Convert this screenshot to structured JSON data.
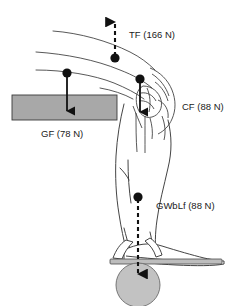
{
  "figure": {
    "type": "biomechanics-force-diagram",
    "title": "",
    "background_color": "#ffffff",
    "line_color": "#3a3a3a",
    "arrow_color": "#111111"
  },
  "forces": [
    {
      "id": "TF",
      "label": "TF (166 N)",
      "abbrev": "TF",
      "magnitude": 166,
      "unit": "N",
      "direction": "up",
      "line_style": "dashed",
      "origin_dot": {
        "x": 115,
        "y": 58
      },
      "arrow_tip": {
        "x": 115,
        "y": 15
      },
      "label_pos": {
        "x": 129,
        "y": 38
      },
      "color": "#111111"
    },
    {
      "id": "CF",
      "label": "CF (88 N)",
      "abbrev": "CF",
      "magnitude": 88,
      "unit": "N",
      "direction": "down",
      "line_style": "solid",
      "origin_dot": {
        "x": 140,
        "y": 79
      },
      "arrow_tip": {
        "x": 140,
        "y": 118
      },
      "label_pos": {
        "x": 182,
        "y": 110
      },
      "color": "#111111"
    },
    {
      "id": "GF",
      "label": "GF (78 N)",
      "abbrev": "GF",
      "magnitude": 78,
      "unit": "N",
      "direction": "down",
      "line_style": "solid",
      "origin_dot": {
        "x": 67,
        "y": 73
      },
      "arrow_tip": {
        "x": 67,
        "y": 117
      },
      "label_pos": {
        "x": 41,
        "y": 137
      },
      "color": "#111111"
    },
    {
      "id": "GWbLf",
      "label": "GWbLf (88 N)",
      "abbrev": "GWbLf",
      "magnitude": 88,
      "unit": "N",
      "direction": "down",
      "line_style": "dashed",
      "origin_dot": {
        "x": 138,
        "y": 197
      },
      "arrow_tip": {
        "x": 138,
        "y": 280
      },
      "label_pos": {
        "x": 156,
        "y": 209
      },
      "color": "#111111"
    }
  ],
  "shapes": {
    "support_bar": {
      "name": "gray-support-bar",
      "x": 12,
      "y": 95,
      "width": 105,
      "height": 25,
      "fill": "#a8a8a8",
      "stroke": "#3a3a3a"
    },
    "weight_disc": {
      "name": "gray-weight-disc",
      "cx": 138,
      "cy": 285,
      "r": 22,
      "fill": "#c2c2c2",
      "stroke": "#6b6b6b"
    },
    "foot_plate": {
      "name": "foot-plate",
      "x": 110,
      "y": 260,
      "width": 112,
      "height": 5,
      "fill": "#bdbdbd",
      "stroke": "#4a4a4a"
    }
  }
}
